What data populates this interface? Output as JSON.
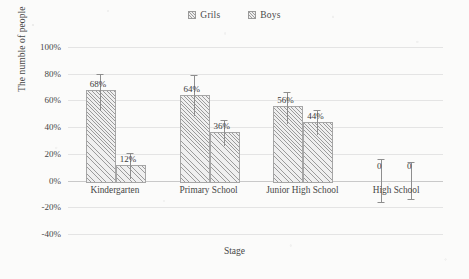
{
  "legend": {
    "position": "top-center",
    "items": [
      {
        "label": "Grils",
        "marker": "hatched-square-swatch"
      },
      {
        "label": "Boys",
        "marker": "hatched-square-swatch"
      }
    ]
  },
  "axes": {
    "y_title": "The numble of people",
    "x_title": "Stage",
    "y_ticks": [
      "100%",
      "80%",
      "60%",
      "40%",
      "20%",
      "0%",
      "-20%",
      "-40%"
    ]
  },
  "chart_data": {
    "type": "bar",
    "title": "",
    "subtitle": "",
    "xlabel": "Stage",
    "ylabel": "The numble of people",
    "categories": [
      "Kindergarten",
      "Primary School",
      "Junior High School",
      "High School"
    ],
    "series": [
      {
        "name": "Grils",
        "values": [
          68,
          64,
          56,
          0
        ],
        "value_labels": [
          "68%",
          "64%",
          "56%",
          "0"
        ],
        "errors_upper": [
          12,
          15,
          10,
          16
        ],
        "errors_lower": [
          16,
          16,
          14,
          16
        ]
      },
      {
        "name": "Boys",
        "values": [
          12,
          36,
          44,
          0
        ],
        "value_labels": [
          "12%",
          "36%",
          "44%",
          "0"
        ],
        "errors_upper": [
          9,
          9,
          9,
          14
        ],
        "errors_lower": [
          11,
          10,
          10,
          14
        ]
      }
    ],
    "ylim": [
      -40,
      100
    ],
    "ytick_step": 20,
    "ytick_suffix": "%",
    "grid": true,
    "grid_axis": "y",
    "legend_position": "top-center",
    "error_bars": true,
    "bar_fill": "diagonal-hatch",
    "colors": {
      "bar_fill": "#efefef",
      "bar_hatch": "#9b9b9b",
      "bar_border": "#a6a6a6",
      "gridline": "#e4e4e4",
      "error_bar": "#8e8e8e",
      "text": "#464646",
      "background": "#fbfbfa"
    }
  }
}
